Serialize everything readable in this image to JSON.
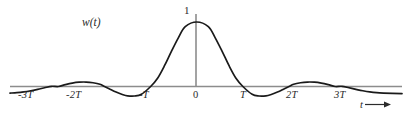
{
  "figure": {
    "function_label": "w(t)",
    "peak_value_label": "1",
    "x_axis_label": "t",
    "x_axis_arrow": "arrow-right-icon",
    "curve_color": "#1a1a1a",
    "axis_color": "#8c8c8c",
    "text_color": "#2b2b2b",
    "background_color": "#ffffff"
  },
  "chart_data": {
    "type": "line",
    "title": "",
    "subtitle": "",
    "xlabel": "t",
    "ylabel": "w(t)",
    "grid": false,
    "legend": "none",
    "annotations": [
      {
        "text": "1",
        "x": 0,
        "y": 1,
        "note": "peak amplitude marked on vertical axis"
      },
      {
        "text": "w(t)",
        "x": -1.55,
        "y": 0.95,
        "note": "curve name label"
      },
      {
        "text": "t",
        "x": 3.6,
        "y": -0.38,
        "note": "horizontal axis name with arrow"
      }
    ],
    "xlim": [
      -4.05,
      4.45
    ],
    "ylim": [
      -0.28,
      1.06
    ],
    "xticks": [
      -3,
      -2,
      -1,
      0,
      1,
      2,
      3
    ],
    "xticklabels": [
      "-3T",
      "-2T",
      "-T",
      "0",
      "T",
      "2T",
      "3T"
    ],
    "yticks": [
      1
    ],
    "yticklabels": [
      "1"
    ],
    "zero_crossings_T": [
      -3,
      -2,
      -1,
      1,
      2,
      3
    ],
    "series": [
      {
        "name": "w(t)",
        "x": [
          -4.05,
          -3.9,
          -3.75,
          -3.6,
          -3.45,
          -3.3,
          -3.15,
          -3.0,
          -2.85,
          -2.7,
          -2.55,
          -2.4,
          -2.25,
          -2.1,
          -2.0,
          -1.9,
          -1.75,
          -1.6,
          -1.5,
          -1.35,
          -1.2,
          -1.0,
          -0.85,
          -0.7,
          -0.55,
          -0.4,
          -0.25,
          0.0,
          0.25,
          0.4,
          0.55,
          0.7,
          0.85,
          1.0,
          1.2,
          1.35,
          1.5,
          1.6,
          1.75,
          1.9,
          2.0,
          2.1,
          2.25,
          2.4,
          2.55,
          2.7,
          2.85,
          3.0,
          3.15,
          3.3,
          3.45,
          3.6,
          3.75,
          3.9,
          4.05,
          4.45
        ],
        "y": [
          -0.102,
          -0.096,
          -0.084,
          -0.066,
          -0.044,
          -0.02,
          0.003,
          0.0,
          0.029,
          0.053,
          0.067,
          0.069,
          0.058,
          0.034,
          0.0,
          -0.034,
          -0.086,
          -0.128,
          -0.145,
          -0.147,
          -0.12,
          0.0,
          0.128,
          0.322,
          0.545,
          0.755,
          0.928,
          1.0,
          0.928,
          0.755,
          0.545,
          0.322,
          0.128,
          0.0,
          -0.12,
          -0.147,
          -0.145,
          -0.128,
          -0.086,
          -0.034,
          0.0,
          0.034,
          0.058,
          0.069,
          0.067,
          0.053,
          0.029,
          0.0,
          0.003,
          -0.02,
          -0.044,
          -0.066,
          -0.084,
          -0.096,
          -0.102,
          -0.112
        ]
      }
    ]
  },
  "tick_labels": [
    {
      "text": "-3T",
      "left": 18,
      "top": 89,
      "italic": true
    },
    {
      "text": "-2T",
      "left": 66,
      "top": 89,
      "italic": true
    },
    {
      "text": "-T",
      "left": 139,
      "top": 89,
      "italic": true
    },
    {
      "text": "0",
      "left": 193,
      "top": 89,
      "italic": false
    },
    {
      "text": "T",
      "left": 240,
      "top": 89,
      "italic": true
    },
    {
      "text": "2T",
      "left": 286,
      "top": 89,
      "italic": true
    },
    {
      "text": "3T",
      "left": 334,
      "top": 89,
      "italic": true
    }
  ]
}
